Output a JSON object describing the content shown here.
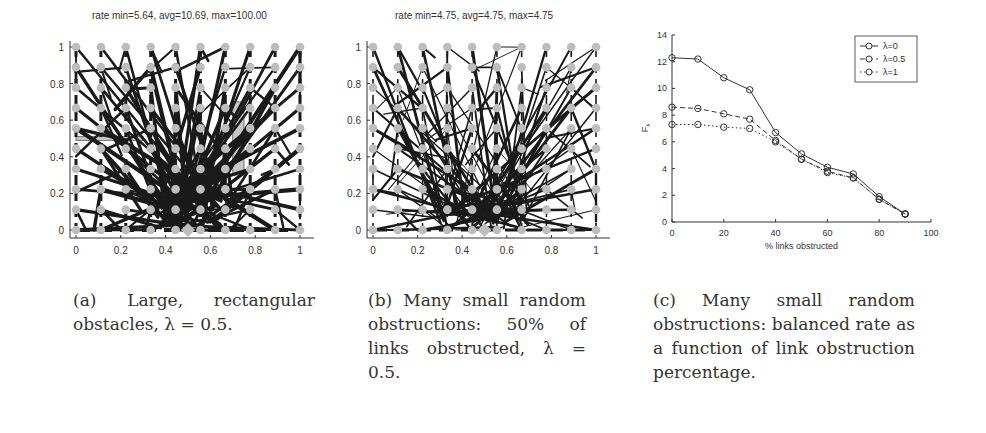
{
  "figure": {
    "panel_a": {
      "title": "rate min=5.64, avg=10.69, max=100.00",
      "x_ticks": [
        "0",
        "0.2",
        "0.4",
        "0.6",
        "0.8",
        "1"
      ],
      "y_ticks": [
        "0",
        "0.2",
        "0.4",
        "0.6",
        "0.8",
        "1"
      ],
      "caption": "(a) Large, rectangular obstacles, λ = 0.5."
    },
    "panel_b": {
      "title": "rate min=4.75, avg=4.75, max=4.75",
      "x_ticks": [
        "0",
        "0.2",
        "0.4",
        "0.6",
        "0.8",
        "1"
      ],
      "y_ticks": [
        "0",
        "0.2",
        "0.4",
        "0.6",
        "0.8",
        "1"
      ],
      "caption": "(b) Many small random obstructions: 50% of links obstructed, λ = 0.5."
    },
    "panel_c": {
      "caption": "(c) Many small random obstructions: balanced rate as a function of link obstruction percentage."
    }
  },
  "chart_data": [
    {
      "type": "scatter",
      "title": "rate min=5.64, avg=10.69, max=100.00",
      "description": "Network graph on 10x10 grid of nodes in unit square with two rectangular obstacles; dense link lines converging to sink at (0.5, 0)",
      "xlim": [
        0,
        1
      ],
      "ylim": [
        0,
        1
      ],
      "obstacles": [
        {
          "x0": 0.0,
          "x1": 0.3,
          "y0": 0.49,
          "y1": 0.51
        },
        {
          "x0": 0.7,
          "x1": 0.75,
          "y0": 0.3,
          "y1": 0.7
        }
      ],
      "sink": [
        0.5,
        0
      ]
    },
    {
      "type": "scatter",
      "title": "rate min=4.75, avg=4.75, max=4.75",
      "description": "Network graph on 10x10 grid of nodes in unit square with many random link obstructions; links converge to sink at (0.5, 0)",
      "xlim": [
        0,
        1
      ],
      "ylim": [
        0,
        1
      ],
      "sink": [
        0.5,
        0
      ]
    },
    {
      "type": "line",
      "title": "",
      "xlabel": "% links obstructed",
      "ylabel": "F_λ",
      "xlim": [
        0,
        100
      ],
      "ylim": [
        0,
        14
      ],
      "x_ticks": [
        0,
        20,
        40,
        60,
        80,
        100
      ],
      "y_ticks": [
        0,
        2,
        4,
        6,
        8,
        10,
        12,
        14
      ],
      "legend_position": "upper right",
      "x": [
        0,
        10,
        20,
        30,
        40,
        50,
        60,
        70,
        80,
        90
      ],
      "series": [
        {
          "name": "λ=0",
          "style": "solid",
          "values": [
            12.3,
            12.2,
            10.8,
            9.9,
            6.7,
            5.1,
            4.1,
            3.6,
            1.9,
            0.6
          ]
        },
        {
          "name": "λ=0.5",
          "style": "dashed",
          "values": [
            8.6,
            8.5,
            8.1,
            7.7,
            6.1,
            4.7,
            3.8,
            3.3,
            1.7,
            0.6
          ]
        },
        {
          "name": "λ=1",
          "style": "dotted",
          "values": [
            7.3,
            7.3,
            7.1,
            7.0,
            6.0,
            4.7,
            3.7,
            3.3,
            1.7,
            0.6
          ]
        }
      ]
    }
  ],
  "colors": {
    "link": "#1a1a1a",
    "node": "#bdbdbd",
    "obstacle": "#c8c8c8",
    "axis": "#333333"
  }
}
